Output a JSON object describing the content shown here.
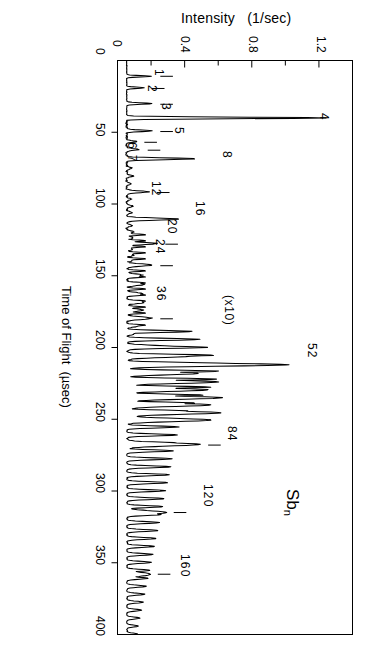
{
  "chart_data": {
    "type": "line",
    "title": "Intensity   (1/sec)",
    "xlabel": "Time of Flight  (µsec)",
    "ylabel": "Intensity   (1/sec)",
    "orientation": "rotated-90-ccw",
    "grid": false,
    "legend": "none",
    "species": "Sb",
    "species_subscript": "n",
    "scale_annotation": "(x10)",
    "scale_annotation_factor": 10,
    "scale_annotation_region_usec": [
      195,
      400
    ],
    "intensity_axis": {
      "label": "Intensity   (1/sec)",
      "ticks": [
        0,
        0.4,
        0.8,
        1.2
      ],
      "tick_labels": [
        "0",
        "0.4",
        "0.8",
        "1.2"
      ],
      "minor_tick_step": 0.2,
      "range": [
        0,
        1.4
      ]
    },
    "time_axis": {
      "label": "Time of Flight  (µsec)",
      "unit": "µsec",
      "ticks": [
        0,
        50,
        100,
        150,
        200,
        250,
        300,
        350,
        400
      ],
      "tick_labels": [
        "0",
        "50",
        "100",
        "150",
        "200",
        "250",
        "300",
        "350",
        "400"
      ],
      "range": [
        0,
        400
      ]
    },
    "peak_labels": [
      {
        "label": "1",
        "tof": 11,
        "intensity": 0.21
      },
      {
        "label": "2",
        "tof": 19.5,
        "intensity": 0.165
      },
      {
        "label": "3",
        "tof": 30.5,
        "intensity": 0.215
      },
      {
        "label": "4",
        "tof": 40.5,
        "intensity": 1.26
      },
      {
        "label": "5",
        "tof": 49.5,
        "intensity": 0.215
      },
      {
        "label": "6",
        "tof": 57,
        "intensity": 0.12
      },
      {
        "label": "7",
        "tof": 62.5,
        "intensity": 0.135
      },
      {
        "label": "8",
        "tof": 69,
        "intensity": 0.48
      },
      {
        "label": "12",
        "tof": 92,
        "intensity": 0.195
      },
      {
        "label": "16",
        "tof": 111,
        "intensity": 0.38
      },
      {
        "label": "20",
        "tof": 128,
        "intensity": 0.245
      },
      {
        "label": "24",
        "tof": 143,
        "intensity": 0.215
      },
      {
        "label": "36",
        "tof": 180,
        "intensity": 0.215
      },
      {
        "label": "52",
        "tof": 212,
        "intensity": 1.05
      },
      {
        "label": "84",
        "tof": 268,
        "intensity": 0.5
      },
      {
        "label": "120",
        "tof": 315,
        "intensity": 0.3
      },
      {
        "label": "160",
        "tof": 358,
        "intensity": 0.2
      }
    ],
    "cluster_series_note": "Antimony cluster Sb_n time-of-flight mass spectrum; peaks labelled by cluster size n",
    "peaks": [
      {
        "n": 1,
        "tof": 11.0,
        "h": 0.205
      },
      {
        "n": 2,
        "tof": 19.0,
        "h": 0.16
      },
      {
        "n": 3,
        "tof": 30.0,
        "h": 0.205
      },
      {
        "n": 4,
        "tof": 40.0,
        "h": 1.25
      },
      {
        "n": 5,
        "tof": 49.0,
        "h": 0.205
      },
      {
        "n": 6,
        "tof": 56.5,
        "h": 0.115
      },
      {
        "n": 7,
        "tof": 62.0,
        "h": 0.13
      },
      {
        "n": 8,
        "tof": 68.5,
        "h": 0.47
      },
      {
        "n": 9,
        "tof": 75.0,
        "h": 0.085
      },
      {
        "n": 10,
        "tof": 80.5,
        "h": 0.095
      },
      {
        "n": 11,
        "tof": 86.0,
        "h": 0.08
      },
      {
        "n": 12,
        "tof": 91.5,
        "h": 0.185
      },
      {
        "n": 13,
        "tof": 96.5,
        "h": 0.08
      },
      {
        "n": 14,
        "tof": 101.5,
        "h": 0.09
      },
      {
        "n": 15,
        "tof": 106.0,
        "h": 0.085
      },
      {
        "n": 16,
        "tof": 110.5,
        "h": 0.37
      },
      {
        "n": 17,
        "tof": 115.0,
        "h": 0.085
      },
      {
        "n": 18,
        "tof": 119.5,
        "h": 0.1
      },
      {
        "n": 19,
        "tof": 123.5,
        "h": 0.09
      },
      {
        "n": 20,
        "tof": 127.5,
        "h": 0.235
      },
      {
        "n": 21,
        "tof": 131.5,
        "h": 0.09
      },
      {
        "n": 22,
        "tof": 135.5,
        "h": 0.095
      },
      {
        "n": 23,
        "tof": 139.0,
        "h": 0.09
      },
      {
        "n": 24,
        "tof": 142.5,
        "h": 0.205
      },
      {
        "n": 26,
        "tof": 149.5,
        "h": 0.15
      },
      {
        "n": 28,
        "tof": 156.0,
        "h": 0.16
      },
      {
        "n": 30,
        "tof": 162.5,
        "h": 0.15
      },
      {
        "n": 32,
        "tof": 168.5,
        "h": 0.16
      },
      {
        "n": 34,
        "tof": 174.0,
        "h": 0.15
      },
      {
        "n": 36,
        "tof": 179.5,
        "h": 0.205
      },
      {
        "n": 38,
        "tof": 185.0,
        "h": 0.12
      },
      {
        "n": 40,
        "tof": 190.0,
        "h": 0.11
      },
      {
        "n": 44,
        "tof": 199.5,
        "h": 0.36
      },
      {
        "n": 48,
        "tof": 206.0,
        "h": 0.43
      },
      {
        "n": 52,
        "tof": 212.0,
        "h": 1.03
      },
      {
        "n": 56,
        "tof": 218.0,
        "h": 0.48
      },
      {
        "n": 60,
        "tof": 224.0,
        "h": 0.6
      },
      {
        "n": 64,
        "tof": 229.5,
        "h": 0.54
      },
      {
        "n": 68,
        "tof": 235.0,
        "h": 0.62
      },
      {
        "n": 72,
        "tof": 240.0,
        "h": 0.56
      },
      {
        "n": 76,
        "tof": 245.5,
        "h": 0.62
      },
      {
        "n": 80,
        "tof": 250.5,
        "h": 0.56
      },
      {
        "n": 84,
        "tof": 267.5,
        "h": 0.49
      },
      {
        "n": 120,
        "tof": 315.0,
        "h": 0.29
      },
      {
        "n": 160,
        "tof": 358.0,
        "h": 0.195
      }
    ]
  }
}
